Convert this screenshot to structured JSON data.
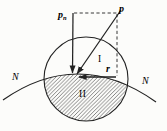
{
  "diagram": {
    "labels": {
      "p": "p",
      "pn_main": "p",
      "pn_sub": "n",
      "r": "r",
      "n_left": "N",
      "n_right": "N",
      "region_upper": "I",
      "region_lower": "II"
    },
    "colors": {
      "ink": "#222222",
      "background": "#fcfcfa"
    }
  }
}
